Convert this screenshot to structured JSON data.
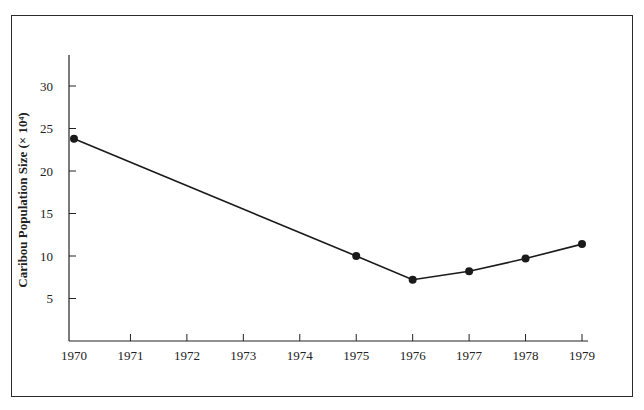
{
  "chart_data": {
    "type": "line",
    "title": "",
    "xlabel": "",
    "ylabel": "Caribou Population Size (× 10⁴)",
    "x": [
      1970,
      1975,
      1976,
      1977,
      1978,
      1979
    ],
    "values": [
      23.8,
      10.0,
      7.2,
      8.2,
      9.7,
      11.4
    ],
    "series": [
      {
        "name": "Caribou population",
        "x": [
          1970,
          1975,
          1976,
          1977,
          1978,
          1979
        ],
        "values": [
          23.8,
          10.0,
          7.2,
          8.2,
          9.7,
          11.4
        ]
      }
    ],
    "x_ticks": [
      "1970",
      "1971",
      "1972",
      "1973",
      "1974",
      "1975",
      "1976",
      "1977",
      "1978",
      "1979"
    ],
    "y_ticks": [
      "5",
      "10",
      "15",
      "20",
      "25",
      "30"
    ],
    "xlim": [
      1970,
      1979
    ],
    "ylim": [
      0,
      33
    ],
    "grid": false,
    "legend": null,
    "markers": "filled-circle",
    "line_color": "#1a1a1a"
  }
}
